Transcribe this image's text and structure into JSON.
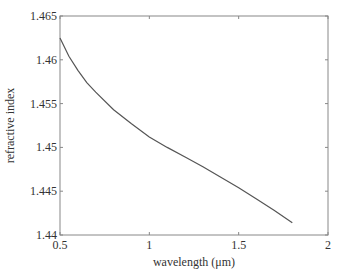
{
  "chart_data": {
    "type": "line",
    "title": "",
    "xlabel": "wavelength (μm)",
    "ylabel": "refractive index",
    "xlim": [
      0.5,
      2
    ],
    "ylim": [
      1.44,
      1.465
    ],
    "xticks": [
      "0.5",
      "1",
      "1.5",
      "2"
    ],
    "yticks": [
      "1.44",
      "1.445",
      "1.45",
      "1.455",
      "1.46",
      "1.465"
    ],
    "grid": false,
    "legend": null,
    "series": [
      {
        "name": "refractive index",
        "color": "#555555",
        "x": [
          0.5,
          0.55,
          0.6,
          0.65,
          0.7,
          0.8,
          0.9,
          1.0,
          1.1,
          1.2,
          1.3,
          1.4,
          1.5,
          1.6,
          1.7,
          1.8
        ],
        "y": [
          1.4625,
          1.4604,
          1.4588,
          1.4574,
          1.4563,
          1.4543,
          1.4527,
          1.4512,
          1.45,
          1.4489,
          1.4478,
          1.4466,
          1.4454,
          1.4441,
          1.4428,
          1.4414
        ]
      }
    ]
  }
}
